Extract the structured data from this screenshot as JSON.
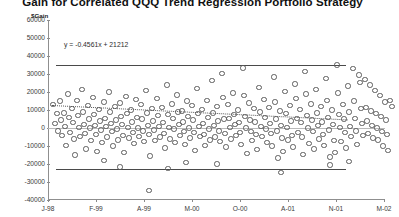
{
  "chart_title": "Gain for Correlated QQQ Trend Regression Portfolio Strategy",
  "axis": {
    "y_title": "$Gain",
    "y_ticks": [
      "60000",
      "50000",
      "40000",
      "30000",
      "20000",
      "10000",
      "0",
      "-10000",
      "-20000",
      "-30000",
      "-40000"
    ],
    "x_ticks": [
      "J-98",
      "F-99",
      "A-99",
      "M-00",
      "O-00",
      "A-01",
      "N-01",
      "M-02"
    ]
  },
  "annotation": {
    "equation": "y = -0.4561x + 21212"
  },
  "chart_data": {
    "type": "scatter",
    "title": "Gain for Correlated QQQ Trend Regression Portfolio Strategy",
    "xlabel": "",
    "ylabel": "$Gain",
    "ylim": [
      -40000,
      60000
    ],
    "grid": false,
    "legend": null,
    "x_tick_labels": [
      "J-98",
      "F-99",
      "A-99",
      "M-00",
      "O-00",
      "A-01",
      "N-01",
      "M-02"
    ],
    "x_tick_positions": [
      0,
      48,
      96,
      144,
      192,
      240,
      288,
      336
    ],
    "y_ticks": [
      60000,
      50000,
      40000,
      30000,
      20000,
      10000,
      0,
      -10000,
      -20000,
      -30000,
      -40000
    ],
    "trendline": {
      "equation": "y = -0.4561x + 21212",
      "style": "dotted",
      "slope": -0.4561,
      "intercept": 21212,
      "y_start": 13000,
      "y_end": 5000
    },
    "reference_lines": [
      {
        "name": "upper-band",
        "value": 35000,
        "style": "solid"
      },
      {
        "name": "lower-band",
        "value": -22500,
        "style": "solid"
      },
      {
        "name": "zero-line",
        "value": 0,
        "style": "solid-gray"
      }
    ],
    "points": [
      [
        4,
        13500
      ],
      [
        6,
        3000
      ],
      [
        8,
        8500
      ],
      [
        9,
        -1000
      ],
      [
        11,
        15500
      ],
      [
        12,
        5000
      ],
      [
        13,
        -3500
      ],
      [
        15,
        9000
      ],
      [
        16,
        1500
      ],
      [
        17,
        -9000
      ],
      [
        19,
        19500
      ],
      [
        20,
        6500
      ],
      [
        21,
        -2000
      ],
      [
        23,
        11500
      ],
      [
        24,
        3500
      ],
      [
        25,
        -5500
      ],
      [
        26,
        -14500
      ],
      [
        28,
        16000
      ],
      [
        29,
        7500
      ],
      [
        30,
        1000
      ],
      [
        31,
        -4000
      ],
      [
        33,
        22000
      ],
      [
        34,
        9500
      ],
      [
        35,
        2500
      ],
      [
        36,
        -2500
      ],
      [
        37,
        -11000
      ],
      [
        39,
        13000
      ],
      [
        40,
        5500
      ],
      [
        41,
        500
      ],
      [
        42,
        -6500
      ],
      [
        44,
        17500
      ],
      [
        45,
        8000
      ],
      [
        46,
        2000
      ],
      [
        47,
        -3000
      ],
      [
        48,
        -12500
      ],
      [
        50,
        11000
      ],
      [
        51,
        4500
      ],
      [
        52,
        -500
      ],
      [
        53,
        -7500
      ],
      [
        55,
        15000
      ],
      [
        56,
        6000
      ],
      [
        57,
        1500
      ],
      [
        58,
        -4500
      ],
      [
        60,
        20500
      ],
      [
        61,
        9500
      ],
      [
        62,
        3000
      ],
      [
        63,
        -1500
      ],
      [
        64,
        -9500
      ],
      [
        66,
        12500
      ],
      [
        67,
        5000
      ],
      [
        68,
        0
      ],
      [
        69,
        -6000
      ],
      [
        71,
        14500
      ],
      [
        72,
        7000
      ],
      [
        73,
        2500
      ],
      [
        74,
        -3500
      ],
      [
        75,
        -13000
      ],
      [
        77,
        18000
      ],
      [
        78,
        8500
      ],
      [
        79,
        1000
      ],
      [
        80,
        -5000
      ],
      [
        82,
        10500
      ],
      [
        83,
        4000
      ],
      [
        84,
        -2000
      ],
      [
        85,
        -8000
      ],
      [
        87,
        16500
      ],
      [
        88,
        6500
      ],
      [
        89,
        500
      ],
      [
        90,
        -4000
      ],
      [
        92,
        13500
      ],
      [
        93,
        5500
      ],
      [
        94,
        -1000
      ],
      [
        95,
        -7000
      ],
      [
        97,
        21500
      ],
      [
        98,
        9000
      ],
      [
        99,
        2000
      ],
      [
        100,
        -3000
      ],
      [
        101,
        -15000
      ],
      [
        103,
        11500
      ],
      [
        104,
        4500
      ],
      [
        105,
        -500
      ],
      [
        106,
        -6500
      ],
      [
        108,
        17000
      ],
      [
        109,
        7500
      ],
      [
        110,
        1500
      ],
      [
        111,
        -4500
      ],
      [
        113,
        12000
      ],
      [
        114,
        3500
      ],
      [
        115,
        -2500
      ],
      [
        116,
        -10500
      ],
      [
        118,
        24500
      ],
      [
        119,
        8000
      ],
      [
        120,
        1000
      ],
      [
        121,
        -5500
      ],
      [
        123,
        14000
      ],
      [
        124,
        6000
      ],
      [
        125,
        0
      ],
      [
        126,
        -7500
      ],
      [
        128,
        19000
      ],
      [
        129,
        9500
      ],
      [
        130,
        2500
      ],
      [
        131,
        -3500
      ],
      [
        133,
        10000
      ],
      [
        134,
        4000
      ],
      [
        135,
        -1500
      ],
      [
        136,
        -8500
      ],
      [
        138,
        15500
      ],
      [
        139,
        7000
      ],
      [
        140,
        500
      ],
      [
        141,
        -5000
      ],
      [
        143,
        13000
      ],
      [
        144,
        5000
      ],
      [
        145,
        -2000
      ],
      [
        146,
        -12000
      ],
      [
        148,
        22500
      ],
      [
        149,
        8500
      ],
      [
        150,
        1500
      ],
      [
        151,
        -4000
      ],
      [
        153,
        11000
      ],
      [
        154,
        3000
      ],
      [
        155,
        -3000
      ],
      [
        156,
        -9000
      ],
      [
        158,
        16000
      ],
      [
        159,
        6500
      ],
      [
        160,
        0
      ],
      [
        161,
        -6000
      ],
      [
        163,
        27000
      ],
      [
        164,
        9000
      ],
      [
        165,
        2000
      ],
      [
        166,
        -4500
      ],
      [
        168,
        12500
      ],
      [
        169,
        4500
      ],
      [
        170,
        -1000
      ],
      [
        171,
        -7000
      ],
      [
        173,
        31000
      ],
      [
        174,
        17500
      ],
      [
        175,
        5500
      ],
      [
        176,
        -2500
      ],
      [
        177,
        -10000
      ],
      [
        179,
        13500
      ],
      [
        180,
        6000
      ],
      [
        181,
        1000
      ],
      [
        182,
        -5500
      ],
      [
        184,
        20000
      ],
      [
        185,
        8000
      ],
      [
        186,
        2500
      ],
      [
        187,
        -3500
      ],
      [
        189,
        10500
      ],
      [
        190,
        3500
      ],
      [
        191,
        -2000
      ],
      [
        192,
        -8500
      ],
      [
        194,
        34000
      ],
      [
        195,
        18500
      ],
      [
        196,
        7000
      ],
      [
        197,
        500
      ],
      [
        198,
        -13500
      ],
      [
        200,
        14500
      ],
      [
        201,
        5000
      ],
      [
        202,
        -1500
      ],
      [
        203,
        -6500
      ],
      [
        205,
        11500
      ],
      [
        206,
        4000
      ],
      [
        207,
        -3000
      ],
      [
        208,
        -11500
      ],
      [
        210,
        23000
      ],
      [
        211,
        9500
      ],
      [
        212,
        1500
      ],
      [
        213,
        -4000
      ],
      [
        215,
        16500
      ],
      [
        216,
        6500
      ],
      [
        217,
        0
      ],
      [
        218,
        -7500
      ],
      [
        220,
        12000
      ],
      [
        221,
        3000
      ],
      [
        222,
        -2500
      ],
      [
        223,
        -9500
      ],
      [
        225,
        29000
      ],
      [
        226,
        15000
      ],
      [
        227,
        5500
      ],
      [
        228,
        -1000
      ],
      [
        229,
        -16000
      ],
      [
        231,
        10000
      ],
      [
        232,
        2000
      ],
      [
        233,
        -5000
      ],
      [
        234,
        -12500
      ],
      [
        236,
        21000
      ],
      [
        237,
        8500
      ],
      [
        238,
        1000
      ],
      [
        239,
        -6000
      ],
      [
        241,
        13000
      ],
      [
        242,
        4500
      ],
      [
        243,
        -3500
      ],
      [
        244,
        -10000
      ],
      [
        246,
        25000
      ],
      [
        247,
        17000
      ],
      [
        248,
        6000
      ],
      [
        249,
        -2000
      ],
      [
        251,
        11000
      ],
      [
        252,
        3500
      ],
      [
        253,
        -4500
      ],
      [
        254,
        -14000
      ],
      [
        256,
        32000
      ],
      [
        257,
        19500
      ],
      [
        258,
        7500
      ],
      [
        259,
        500
      ],
      [
        260,
        -8000
      ],
      [
        262,
        14000
      ],
      [
        263,
        5000
      ],
      [
        264,
        -1500
      ],
      [
        265,
        -11000
      ],
      [
        267,
        22000
      ],
      [
        268,
        9000
      ],
      [
        269,
        2000
      ],
      [
        270,
        -5500
      ],
      [
        272,
        12500
      ],
      [
        273,
        4000
      ],
      [
        274,
        -3000
      ],
      [
        275,
        -9000
      ],
      [
        277,
        28000
      ],
      [
        278,
        16000
      ],
      [
        279,
        6500
      ],
      [
        280,
        -500
      ],
      [
        281,
        -15500
      ],
      [
        283,
        10500
      ],
      [
        284,
        2500
      ],
      [
        285,
        -6500
      ],
      [
        286,
        -13000
      ],
      [
        288,
        35500
      ],
      [
        289,
        20000
      ],
      [
        290,
        8000
      ],
      [
        291,
        1000
      ],
      [
        292,
        -7000
      ],
      [
        294,
        13500
      ],
      [
        295,
        5500
      ],
      [
        296,
        -2000
      ],
      [
        297,
        -10500
      ],
      [
        299,
        24000
      ],
      [
        300,
        9500
      ],
      [
        301,
        1500
      ],
      [
        302,
        -4000
      ],
      [
        304,
        33500
      ],
      [
        305,
        15500
      ],
      [
        306,
        6000
      ],
      [
        307,
        -1000
      ],
      [
        308,
        -8500
      ],
      [
        310,
        30000
      ],
      [
        311,
        26000
      ],
      [
        312,
        11500
      ],
      [
        313,
        3000
      ],
      [
        314,
        -3500
      ],
      [
        316,
        27500
      ],
      [
        317,
        12000
      ],
      [
        318,
        4500
      ],
      [
        319,
        -2500
      ],
      [
        321,
        24500
      ],
      [
        322,
        10000
      ],
      [
        323,
        2000
      ],
      [
        324,
        -5000
      ],
      [
        326,
        21500
      ],
      [
        327,
        8500
      ],
      [
        328,
        500
      ],
      [
        329,
        -6000
      ],
      [
        331,
        18500
      ],
      [
        332,
        7000
      ],
      [
        333,
        -1500
      ],
      [
        334,
        -9500
      ],
      [
        336,
        15000
      ],
      [
        337,
        5000
      ],
      [
        338,
        -3000
      ],
      [
        339,
        -12000
      ],
      [
        100,
        -34000
      ],
      [
        119,
        -22000
      ],
      [
        137,
        -18500
      ],
      [
        71,
        -21000
      ],
      [
        281,
        -20000
      ],
      [
        300,
        -18000
      ],
      [
        55,
        -17500
      ],
      [
        168,
        -19500
      ],
      [
        232,
        -24000
      ],
      [
        341,
        16000
      ],
      [
        343,
        12500
      ]
    ]
  }
}
